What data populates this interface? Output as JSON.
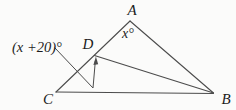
{
  "figure": {
    "background_color": "#fbfbfa",
    "line_color": "#4c4c4c",
    "text_color": "#1c1c1c",
    "canvas": {
      "width": 236,
      "height": 110
    },
    "vertex_labels": {
      "A": "A",
      "B": "B",
      "C": "C",
      "D": "D"
    },
    "angle_labels": {
      "at_A": "x°",
      "at_D": "(x +20)°"
    },
    "segments": [
      {
        "name": "side-CA-line",
        "points": "56,92 130,21",
        "width": 1.1
      },
      {
        "name": "side-AB-line",
        "points": "130,21 213.5,93",
        "width": 1.1
      },
      {
        "name": "side-CB-line",
        "points": "56,92 213.5,93.5",
        "width": 1.1
      },
      {
        "name": "segment-DB-line",
        "points": "94.5,55.5 213.5,93",
        "width": 1.1
      },
      {
        "name": "angle-leader-line",
        "points": "55,48 93,88 95.3,61.5",
        "width": 1.0
      }
    ],
    "arrowhead": {
      "points": "95.9,56.5 93.4,65 98.2,64.3"
    },
    "texts": [
      {
        "name": "vertex-label-A",
        "text": "A",
        "x": 132,
        "y": 14.5,
        "anchor": "middle",
        "size": 15
      },
      {
        "name": "angle-label-x",
        "text": "x°",
        "x": 128,
        "y": 37.5,
        "anchor": "middle",
        "size": 14
      },
      {
        "name": "vertex-label-D",
        "text": "D",
        "x": 88,
        "y": 48.5,
        "anchor": "middle",
        "size": 15
      },
      {
        "name": "angle-label-x-plus-20",
        "text": "(x +20)°",
        "x": 12,
        "y": 51.5,
        "anchor": "start",
        "size": 14.5
      },
      {
        "name": "vertex-label-C",
        "text": "C",
        "x": 48,
        "y": 104,
        "anchor": "middle",
        "size": 15
      },
      {
        "name": "vertex-label-B",
        "text": "B",
        "x": 226,
        "y": 104,
        "anchor": "middle",
        "size": 15
      }
    ]
  }
}
